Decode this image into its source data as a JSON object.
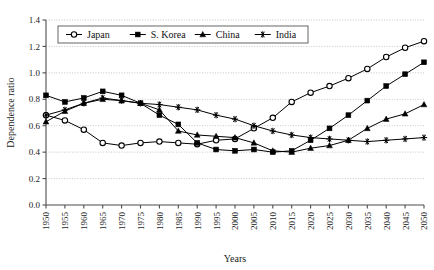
{
  "chart_data": {
    "type": "line",
    "title": "",
    "xlabel": "Years",
    "ylabel": "Dependence ratio",
    "xlim": [
      1950,
      2050
    ],
    "ylim": [
      0.0,
      1.4
    ],
    "ytick_step": 0.2,
    "grid": true,
    "legend_position": "top-left-inside",
    "x": [
      1950,
      1955,
      1960,
      1965,
      1970,
      1975,
      1980,
      1985,
      1990,
      1995,
      2000,
      2005,
      2010,
      2015,
      2020,
      2025,
      2030,
      2035,
      2040,
      2045,
      2050
    ],
    "categories": [
      "1950",
      "1955",
      "1960",
      "1965",
      "1970",
      "1975",
      "1980",
      "1985",
      "1990",
      "1995",
      "2000",
      "2005",
      "2010",
      "2015",
      "2020",
      "2025",
      "2030",
      "2035",
      "2040",
      "2045",
      "2050"
    ],
    "yticks": [
      "0.0",
      "0.2",
      "0.4",
      "0.6",
      "0.8",
      "1.0",
      "1.2",
      "1.4"
    ],
    "series": [
      {
        "name": "Japan",
        "marker": "open-circle",
        "values": [
          0.68,
          0.64,
          0.57,
          0.47,
          0.45,
          0.47,
          0.48,
          0.47,
          0.46,
          0.49,
          0.5,
          0.58,
          0.66,
          0.78,
          0.85,
          0.9,
          0.96,
          1.03,
          1.12,
          1.19,
          1.24
        ]
      },
      {
        "name": "S. Korea",
        "marker": "filled-square",
        "values": [
          0.83,
          0.78,
          0.81,
          0.86,
          0.83,
          0.77,
          0.68,
          0.61,
          0.47,
          0.42,
          0.41,
          0.42,
          0.4,
          0.41,
          0.49,
          0.58,
          0.68,
          0.79,
          0.9,
          0.99,
          1.08
        ]
      },
      {
        "name": "China",
        "marker": "filled-triangle",
        "values": [
          0.63,
          0.71,
          0.77,
          0.8,
          0.79,
          0.77,
          0.72,
          0.56,
          0.53,
          0.52,
          0.51,
          0.47,
          0.41,
          0.4,
          0.43,
          0.45,
          0.49,
          0.58,
          0.65,
          0.69,
          0.76
        ]
      },
      {
        "name": "India",
        "marker": "asterisk",
        "values": [
          0.68,
          0.72,
          0.77,
          0.81,
          0.79,
          0.77,
          0.76,
          0.74,
          0.72,
          0.68,
          0.65,
          0.6,
          0.56,
          0.53,
          0.51,
          0.5,
          0.49,
          0.48,
          0.49,
          0.5,
          0.51
        ]
      }
    ]
  },
  "axes": {
    "x_title": "Years",
    "y_title": "Dependence ratio"
  },
  "legend": {
    "entries": [
      {
        "label": "Japan",
        "marker": "open-circle"
      },
      {
        "label": "S. Korea",
        "marker": "filled-square"
      },
      {
        "label": "China",
        "marker": "filled-triangle"
      },
      {
        "label": "India",
        "marker": "asterisk"
      }
    ]
  },
  "colors": {
    "line": "#000000",
    "grid": "#b9b9b9",
    "axis": "#4d4d4d",
    "background": "#ffffff"
  }
}
